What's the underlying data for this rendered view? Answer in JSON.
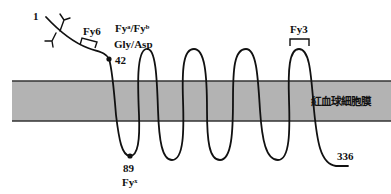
{
  "diagram": {
    "type": "membrane-protein-topology",
    "membrane": {
      "label": "紅血球細胞膜",
      "fill_color": "#b3b3b3",
      "edge_color": "#333333"
    },
    "strand_color": "#111111",
    "labels": {
      "n_terminus": "1",
      "c_terminus": "336",
      "epitope_fy6": "Fy6",
      "epitope_fy3": "Fy3",
      "antigen_line1": "Fyᵃ/Fyᵇ",
      "antigen_line2": "Gly/Asp",
      "residue_42": "42",
      "residue_89": "89",
      "residue_89_antigen": "Fyˣ"
    }
  }
}
